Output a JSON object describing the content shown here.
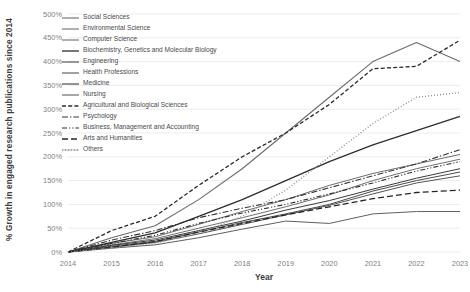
{
  "chart_data": {
    "type": "line",
    "title": "",
    "xlabel": "Year",
    "ylabel": "% Growth in engaged research publications since 2014",
    "x": [
      2014,
      2015,
      2016,
      2017,
      2018,
      2019,
      2020,
      2021,
      2022,
      2023
    ],
    "xtick_labels": [
      "2014",
      "2015",
      "2016",
      "2017",
      "2018",
      "2019",
      "2020",
      "2021",
      "2022",
      "2023"
    ],
    "ytick_labels": [
      "0%",
      "50%",
      "100%",
      "150%",
      "200%",
      "250%",
      "300%",
      "350%",
      "400%",
      "450%",
      "500%"
    ],
    "ytick_values": [
      0,
      50,
      100,
      150,
      200,
      250,
      300,
      350,
      400,
      450,
      500
    ],
    "ylim": [
      0,
      500
    ],
    "xlim": [
      2014,
      2023
    ],
    "grid": true,
    "legend_position": "top-left-inside",
    "series": [
      {
        "name": "Social Sciences",
        "dash": "solid",
        "color": "#6b6b6b",
        "width": 1.1,
        "values": [
          0,
          30,
          55,
          110,
          175,
          250,
          325,
          400,
          440,
          400
        ]
      },
      {
        "name": "Environmental Science",
        "dash": "solid",
        "color": "#6e6e6e",
        "width": 1.0,
        "values": [
          0,
          18,
          32,
          58,
          85,
          110,
          140,
          165,
          185,
          205
        ]
      },
      {
        "name": "Computer Science",
        "dash": "solid",
        "color": "#707070",
        "width": 1.0,
        "values": [
          0,
          15,
          28,
          50,
          72,
          95,
          120,
          150,
          175,
          195
        ]
      },
      {
        "name": "Biochemistry, Genetics and Molecular Biology",
        "dash": "solid",
        "color": "#2d2d2d",
        "width": 1.3,
        "values": [
          0,
          20,
          40,
          75,
          110,
          150,
          190,
          225,
          255,
          285
        ]
      },
      {
        "name": "Engineering",
        "dash": "solid",
        "color": "#4a4a4a",
        "width": 1.0,
        "values": [
          0,
          12,
          22,
          42,
          62,
          80,
          100,
          128,
          150,
          168
        ]
      },
      {
        "name": "Health Professions",
        "dash": "solid",
        "color": "#555555",
        "width": 1.0,
        "values": [
          0,
          10,
          20,
          38,
          58,
          78,
          98,
          122,
          145,
          160
        ]
      },
      {
        "name": "Medicine",
        "dash": "solid",
        "color": "#3a3a3a",
        "width": 1.0,
        "values": [
          0,
          14,
          25,
          45,
          65,
          88,
          108,
          132,
          155,
          175
        ]
      },
      {
        "name": "Nursing",
        "dash": "solid",
        "color": "#5f5f5f",
        "width": 1.0,
        "values": [
          0,
          8,
          15,
          30,
          48,
          65,
          60,
          80,
          85,
          85
        ]
      },
      {
        "name": "Agricultural and Biological Sciences",
        "dash": "dashed",
        "color": "#2a2a2a",
        "width": 1.3,
        "values": [
          0,
          45,
          75,
          140,
          200,
          250,
          310,
          385,
          390,
          445
        ]
      },
      {
        "name": "Psychology",
        "dash": "dashdot",
        "color": "#353535",
        "width": 1.1,
        "values": [
          0,
          25,
          45,
          72,
          92,
          110,
          135,
          160,
          185,
          215
        ]
      },
      {
        "name": "Business, Management and Accounting",
        "dash": "dashdotdot",
        "color": "#303030",
        "width": 1.1,
        "values": [
          0,
          18,
          35,
          60,
          82,
          100,
          122,
          145,
          170,
          190
        ]
      },
      {
        "name": "Arts and Humanities",
        "dash": "longdash",
        "color": "#272727",
        "width": 1.3,
        "values": [
          0,
          10,
          22,
          42,
          60,
          78,
          95,
          112,
          125,
          130
        ]
      },
      {
        "name": "Others",
        "dash": "dotted",
        "color": "#8a8a8a",
        "width": 1.4,
        "values": [
          0,
          8,
          18,
          40,
          75,
          130,
          200,
          270,
          325,
          335
        ]
      }
    ]
  }
}
